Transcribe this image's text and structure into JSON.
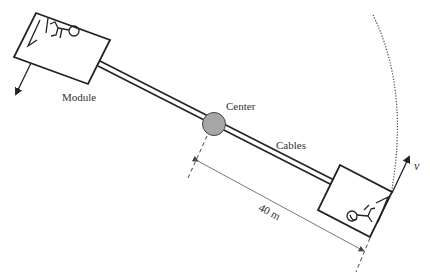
{
  "diagram": {
    "labels": {
      "module": "Module",
      "center": "Center",
      "cables": "Cables",
      "distance": "40 m",
      "velocity": "v"
    },
    "colors": {
      "stroke": "#222222",
      "center_fill": "#a6a6a6",
      "text": "#333333"
    },
    "icons": {
      "left_module_occupant": "astronaut-icon",
      "right_module_occupant": "astronaut-icon"
    }
  }
}
